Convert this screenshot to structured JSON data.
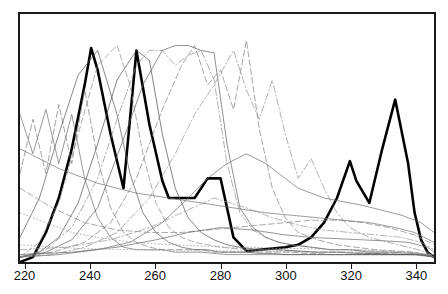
{
  "chart_data": {
    "type": "line",
    "title": "",
    "subtitle": "",
    "xlabel": "",
    "ylabel": "",
    "xlim": [
      218,
      346
    ],
    "ylim": [
      0,
      1
    ],
    "grid": false,
    "legend": "none",
    "xticks": [
      220,
      240,
      260,
      280,
      300,
      320,
      340
    ],
    "xtick_labels": [
      "220",
      "240",
      "260",
      "280",
      "300",
      "320",
      "340"
    ],
    "yticks": [],
    "ytick_labels": [],
    "annotations": [],
    "series": [
      {
        "name": "highlighted-bold-series",
        "style": "solid",
        "width": 2.6,
        "color": "#000000",
        "x": [
          218,
          222,
          226,
          230,
          234,
          238,
          240,
          242,
          246,
          250,
          254,
          258,
          262,
          264,
          268,
          272,
          276,
          280,
          284,
          288,
          292,
          296,
          300,
          304,
          308,
          312,
          316,
          320,
          322,
          326,
          330,
          334,
          338,
          340,
          342,
          344,
          346
        ],
        "values": [
          0.0,
          0.02,
          0.12,
          0.26,
          0.46,
          0.72,
          0.87,
          0.78,
          0.52,
          0.3,
          0.86,
          0.56,
          0.33,
          0.26,
          0.26,
          0.26,
          0.34,
          0.34,
          0.1,
          0.045,
          0.05,
          0.055,
          0.06,
          0.07,
          0.1,
          0.16,
          0.26,
          0.41,
          0.33,
          0.24,
          0.46,
          0.66,
          0.4,
          0.2,
          0.09,
          0.04,
          0.02
        ]
      },
      {
        "name": "background-series-1",
        "style": "solid",
        "width": 0.7,
        "color": "#6e6e6e",
        "x": [
          218,
          222,
          226,
          230,
          234,
          238,
          242,
          246,
          250,
          254,
          258,
          262,
          266,
          270,
          274,
          278,
          282,
          286,
          290,
          294,
          298,
          302,
          306,
          310,
          314,
          318,
          322,
          326,
          330,
          334,
          338,
          342,
          346
        ],
        "values": [
          0.6,
          0.44,
          0.62,
          0.4,
          0.6,
          0.34,
          0.18,
          0.1,
          0.06,
          0.05,
          0.05,
          0.05,
          0.04,
          0.04,
          0.04,
          0.035,
          0.03,
          0.03,
          0.03,
          0.03,
          0.03,
          0.03,
          0.03,
          0.03,
          0.03,
          0.03,
          0.03,
          0.03,
          0.03,
          0.03,
          0.03,
          0.03,
          0.02
        ]
      },
      {
        "name": "background-series-2",
        "style": "dashed",
        "width": 0.7,
        "color": "#7a7a7a",
        "x": [
          218,
          222,
          226,
          230,
          234,
          238,
          242,
          246,
          250,
          254,
          258,
          262,
          266,
          270,
          274,
          278,
          282,
          286,
          290,
          294,
          298,
          302,
          306,
          310,
          314,
          318,
          322,
          326,
          330,
          334,
          338,
          342,
          346
        ],
        "values": [
          0.36,
          0.58,
          0.36,
          0.64,
          0.4,
          0.7,
          0.42,
          0.22,
          0.12,
          0.08,
          0.06,
          0.05,
          0.05,
          0.05,
          0.05,
          0.04,
          0.04,
          0.04,
          0.04,
          0.04,
          0.04,
          0.04,
          0.035,
          0.035,
          0.03,
          0.03,
          0.03,
          0.03,
          0.03,
          0.03,
          0.03,
          0.03,
          0.02
        ]
      },
      {
        "name": "background-series-3",
        "style": "solid",
        "width": 0.7,
        "color": "#555555",
        "x": [
          218,
          224,
          230,
          236,
          242,
          248,
          252,
          256,
          260,
          264,
          268,
          272,
          276,
          280,
          284,
          288,
          292,
          296,
          300,
          306,
          312,
          318,
          324,
          330,
          336,
          342,
          346
        ],
        "values": [
          0.1,
          0.26,
          0.52,
          0.76,
          0.86,
          0.6,
          0.36,
          0.2,
          0.12,
          0.08,
          0.06,
          0.05,
          0.05,
          0.04,
          0.04,
          0.04,
          0.035,
          0.035,
          0.03,
          0.03,
          0.03,
          0.03,
          0.03,
          0.03,
          0.03,
          0.03,
          0.02
        ]
      },
      {
        "name": "background-series-4",
        "style": "dashed",
        "width": 0.7,
        "color": "#8a8a8a",
        "x": [
          218,
          224,
          230,
          236,
          242,
          248,
          252,
          256,
          260,
          264,
          268,
          272,
          276,
          280,
          284,
          290,
          296,
          302,
          308,
          314,
          320,
          326,
          332,
          338,
          344,
          346
        ],
        "values": [
          0.02,
          0.08,
          0.24,
          0.52,
          0.8,
          0.88,
          0.72,
          0.44,
          0.24,
          0.14,
          0.1,
          0.08,
          0.07,
          0.06,
          0.055,
          0.05,
          0.05,
          0.045,
          0.04,
          0.04,
          0.04,
          0.035,
          0.035,
          0.03,
          0.03,
          0.02
        ]
      },
      {
        "name": "background-series-5",
        "style": "solid",
        "width": 0.7,
        "color": "#4d4d4d",
        "x": [
          218,
          224,
          230,
          236,
          242,
          248,
          254,
          258,
          262,
          266,
          270,
          274,
          278,
          282,
          286,
          292,
          298,
          304,
          310,
          316,
          322,
          328,
          334,
          340,
          346
        ],
        "values": [
          0.02,
          0.04,
          0.1,
          0.24,
          0.48,
          0.74,
          0.86,
          0.82,
          0.52,
          0.3,
          0.18,
          0.12,
          0.09,
          0.07,
          0.06,
          0.05,
          0.05,
          0.045,
          0.04,
          0.04,
          0.035,
          0.035,
          0.03,
          0.03,
          0.02
        ]
      },
      {
        "name": "background-series-6",
        "style": "dashdot",
        "width": 0.7,
        "color": "#8c8c8c",
        "x": [
          218,
          226,
          234,
          242,
          248,
          254,
          258,
          262,
          266,
          270,
          274,
          278,
          282,
          286,
          290,
          294,
          298,
          302,
          308,
          314,
          320,
          326,
          332,
          338,
          344,
          346
        ],
        "values": [
          0.02,
          0.05,
          0.14,
          0.34,
          0.58,
          0.8,
          0.86,
          0.86,
          0.8,
          0.84,
          0.86,
          0.74,
          0.4,
          0.2,
          0.13,
          0.1,
          0.08,
          0.07,
          0.06,
          0.05,
          0.05,
          0.045,
          0.04,
          0.04,
          0.03,
          0.02
        ]
      },
      {
        "name": "background-series-7",
        "style": "solid",
        "width": 0.7,
        "color": "#5f5f5f",
        "x": [
          218,
          226,
          234,
          242,
          250,
          256,
          262,
          266,
          270,
          274,
          278,
          282,
          286,
          290,
          294,
          298,
          302,
          308,
          314,
          320,
          326,
          332,
          338,
          344,
          346
        ],
        "values": [
          0.02,
          0.04,
          0.09,
          0.22,
          0.5,
          0.72,
          0.86,
          0.88,
          0.88,
          0.86,
          0.85,
          0.48,
          0.22,
          0.14,
          0.1,
          0.08,
          0.07,
          0.06,
          0.05,
          0.05,
          0.04,
          0.04,
          0.035,
          0.03,
          0.02
        ]
      },
      {
        "name": "background-series-8",
        "style": "dashed",
        "width": 0.7,
        "color": "#7d7d7d",
        "x": [
          218,
          228,
          238,
          246,
          254,
          262,
          268,
          272,
          276,
          280,
          284,
          288,
          292,
          296,
          300,
          304,
          310,
          316,
          322,
          328,
          334,
          340,
          346
        ],
        "values": [
          0.02,
          0.04,
          0.08,
          0.16,
          0.34,
          0.62,
          0.8,
          0.88,
          0.72,
          0.78,
          0.62,
          0.9,
          0.54,
          0.3,
          0.18,
          0.12,
          0.09,
          0.07,
          0.06,
          0.05,
          0.045,
          0.04,
          0.02
        ]
      },
      {
        "name": "background-series-9",
        "style": "dashdot",
        "width": 0.7,
        "color": "#8f8f8f",
        "x": [
          218,
          228,
          238,
          248,
          258,
          266,
          272,
          278,
          284,
          288,
          292,
          296,
          300,
          304,
          308,
          312,
          316,
          320,
          326,
          332,
          338,
          344,
          346
        ],
        "values": [
          0.02,
          0.03,
          0.06,
          0.12,
          0.26,
          0.44,
          0.6,
          0.72,
          0.86,
          0.7,
          0.58,
          0.74,
          0.52,
          0.34,
          0.42,
          0.3,
          0.2,
          0.14,
          0.1,
          0.08,
          0.06,
          0.04,
          0.02
        ]
      },
      {
        "name": "background-series-10",
        "style": "solid",
        "width": 0.7,
        "color": "#6a6a6a",
        "x": [
          218,
          230,
          242,
          252,
          262,
          270,
          276,
          282,
          288,
          294,
          300,
          304,
          308,
          312,
          316,
          320,
          324,
          330,
          336,
          342,
          346
        ],
        "values": [
          0.02,
          0.03,
          0.05,
          0.08,
          0.16,
          0.26,
          0.34,
          0.4,
          0.44,
          0.4,
          0.34,
          0.3,
          0.28,
          0.26,
          0.25,
          0.24,
          0.23,
          0.21,
          0.19,
          0.16,
          0.12
        ]
      },
      {
        "name": "background-series-11",
        "style": "dotted",
        "width": 0.7,
        "color": "#9a9a9a",
        "x": [
          218,
          226,
          234,
          242,
          250,
          258,
          266,
          274,
          282,
          290,
          298,
          306,
          314,
          322,
          330,
          338,
          346
        ],
        "values": [
          0.2,
          0.16,
          0.12,
          0.1,
          0.085,
          0.075,
          0.07,
          0.065,
          0.06,
          0.06,
          0.055,
          0.055,
          0.05,
          0.05,
          0.045,
          0.04,
          0.03
        ]
      },
      {
        "name": "background-series-12",
        "style": "dashed",
        "width": 0.7,
        "color": "#858585",
        "x": [
          218,
          228,
          238,
          248,
          258,
          268,
          276,
          284,
          292,
          300,
          308,
          316,
          324,
          332,
          340,
          346
        ],
        "values": [
          0.3,
          0.22,
          0.16,
          0.13,
          0.12,
          0.12,
          0.13,
          0.14,
          0.15,
          0.16,
          0.17,
          0.17,
          0.16,
          0.14,
          0.11,
          0.07
        ]
      },
      {
        "name": "background-series-13",
        "style": "solid",
        "width": 0.7,
        "color": "#707070",
        "x": [
          218,
          230,
          242,
          254,
          264,
          274,
          284,
          294,
          302,
          310,
          318,
          326,
          334,
          340,
          346
        ],
        "values": [
          0.46,
          0.38,
          0.32,
          0.28,
          0.26,
          0.24,
          0.22,
          0.2,
          0.19,
          0.18,
          0.17,
          0.16,
          0.14,
          0.12,
          0.08
        ]
      },
      {
        "name": "background-series-14",
        "style": "dashdot",
        "width": 0.7,
        "color": "#949494",
        "x": [
          218,
          232,
          246,
          258,
          268,
          278,
          288,
          296,
          304,
          312,
          320,
          328,
          336,
          342,
          346
        ],
        "values": [
          0.05,
          0.06,
          0.09,
          0.14,
          0.2,
          0.26,
          0.22,
          0.18,
          0.15,
          0.13,
          0.12,
          0.11,
          0.1,
          0.08,
          0.05
        ]
      },
      {
        "name": "background-series-15",
        "style": "solid",
        "width": 0.7,
        "color": "#636363",
        "x": [
          218,
          234,
          248,
          260,
          270,
          280,
          290,
          300,
          308,
          316,
          324,
          332,
          338,
          344,
          346
        ],
        "values": [
          0.03,
          0.04,
          0.06,
          0.09,
          0.12,
          0.14,
          0.13,
          0.11,
          0.1,
          0.095,
          0.09,
          0.085,
          0.08,
          0.06,
          0.04
        ]
      },
      {
        "name": "background-series-16",
        "style": "dotted",
        "width": 0.7,
        "color": "#a0a0a0",
        "x": [
          218,
          236,
          252,
          266,
          280,
          292,
          304,
          316,
          328,
          338,
          346
        ],
        "values": [
          0.07,
          0.055,
          0.05,
          0.045,
          0.045,
          0.045,
          0.04,
          0.04,
          0.04,
          0.035,
          0.03
        ]
      }
    ]
  }
}
